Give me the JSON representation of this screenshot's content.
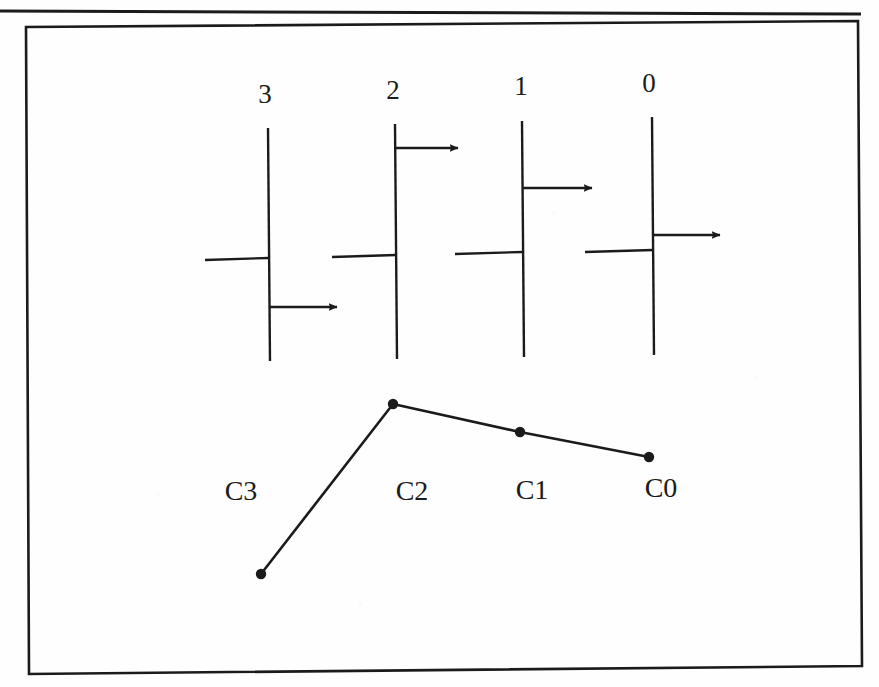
{
  "page": {
    "width": 879,
    "height": 687,
    "background_color": "#fefefe",
    "ink_color": "#1b1b1b"
  },
  "page_rule": {
    "name": "top-page-rule",
    "x1": 0,
    "y1": 11,
    "x2": 861,
    "y2": 14,
    "stroke_width": 3
  },
  "frame": {
    "name": "figure-frame",
    "points": "26,27 858,21 862,666 29,674",
    "stroke_width": 2.6
  },
  "chart_data": {
    "type": "diagram",
    "title": "",
    "subtitle": "",
    "top_diagram": {
      "name": "signal-lines-group",
      "axis_labels": [
        "3",
        "2",
        "1",
        "0"
      ],
      "lines": [
        {
          "label": "3",
          "label_x": 265,
          "label_y": 103,
          "stem_x": 268,
          "stem_y_top": 128,
          "stem_y_bottom": 361,
          "crossbar_y": 258,
          "crossbar_x_left": 205,
          "arrow_y": 307,
          "arrow_x_end": 337
        },
        {
          "label": "2",
          "label_x": 393,
          "label_y": 99,
          "stem_x": 395,
          "stem_y_top": 124,
          "stem_y_bottom": 359,
          "crossbar_y": 255,
          "crossbar_x_left": 332,
          "arrow_y": 148,
          "arrow_x_end": 458
        },
        {
          "label": "1",
          "label_x": 521,
          "label_y": 95,
          "stem_x": 522,
          "stem_y_top": 121,
          "stem_y_bottom": 357,
          "crossbar_y": 252,
          "crossbar_x_left": 455,
          "arrow_y": 188,
          "arrow_x_end": 592
        },
        {
          "label": "0",
          "label_x": 649,
          "label_y": 92,
          "stem_x": 652,
          "stem_y_top": 117,
          "stem_y_bottom": 355,
          "crossbar_y": 250,
          "crossbar_x_left": 585,
          "arrow_y": 235,
          "arrow_x_end": 720
        }
      ]
    },
    "bottom_plot": {
      "name": "carry-polyline",
      "categories": [
        "C3",
        "C2",
        "C1",
        "C0"
      ],
      "points": [
        {
          "label": "C3",
          "x": 261,
          "y": 574,
          "label_x": 241,
          "label_y": 500
        },
        {
          "label": "C2",
          "x": 393,
          "y": 404,
          "label_x": 412,
          "label_y": 500
        },
        {
          "label": "C1",
          "x": 520,
          "y": 432,
          "label_x": 532,
          "label_y": 499
        },
        {
          "label": "C0",
          "x": 649,
          "y": 457,
          "label_x": 661,
          "label_y": 497
        }
      ],
      "marker_radius": 5.2,
      "line_stroke_width": 2.6,
      "polyline": "261,574 393,404 520,432 649,457"
    }
  }
}
